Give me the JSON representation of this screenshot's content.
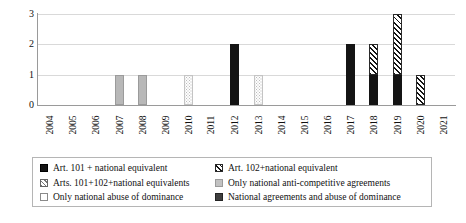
{
  "chart_data": {
    "type": "bar",
    "stacked": true,
    "title": "",
    "xlabel": "",
    "ylabel": "",
    "ylim": [
      0,
      3
    ],
    "yticks": [
      "0",
      "1",
      "2",
      "3"
    ],
    "grid": true,
    "legend_position": "bottom",
    "categories": [
      "2004",
      "2005",
      "2006",
      "2007",
      "2008",
      "2009",
      "2010",
      "2011",
      "2012",
      "2013",
      "2014",
      "2015",
      "2016",
      "2017",
      "2018",
      "2019",
      "2020",
      "2021"
    ],
    "series": [
      {
        "name": "Art. 101 + national equivalent",
        "key": "s101",
        "values": [
          0,
          0,
          0,
          0,
          0,
          0,
          0,
          0,
          2,
          0,
          0,
          0,
          0,
          2,
          1,
          1,
          0,
          0
        ]
      },
      {
        "name": "Art. 102+national equivalent",
        "key": "s102",
        "values": [
          0,
          0,
          0,
          0,
          0,
          0,
          0,
          0,
          0,
          0,
          0,
          0,
          0,
          0,
          1,
          2,
          1,
          0
        ]
      },
      {
        "name": "Arts. 101+102+national equivalents",
        "key": "sboth",
        "values": [
          0,
          0,
          0,
          0,
          0,
          0,
          0,
          0,
          0,
          0,
          0,
          0,
          0,
          0,
          0,
          0,
          0,
          0
        ]
      },
      {
        "name": "Only national anti-competitive agreements",
        "key": "snatagr",
        "values": [
          0,
          0,
          0,
          1,
          1,
          0,
          0,
          0,
          0,
          0,
          0,
          0,
          0,
          0,
          0,
          0,
          0,
          0
        ]
      },
      {
        "name": "Only national abuse of dominance",
        "key": "snatdom",
        "values": [
          0,
          0,
          0,
          0,
          0,
          0,
          1,
          0,
          0,
          1,
          0,
          0,
          0,
          0,
          0,
          0,
          0,
          0
        ]
      },
      {
        "name": "National agreements and abuse of dominance",
        "key": "snatmix",
        "values": [
          0,
          0,
          0,
          0,
          0,
          0,
          0,
          0,
          0,
          0,
          0,
          0,
          0,
          0,
          0,
          0,
          0,
          0
        ]
      }
    ],
    "totals": [
      0,
      0,
      0,
      1,
      1,
      0,
      1,
      0,
      2,
      1,
      0,
      0,
      0,
      2,
      2,
      3,
      1,
      0
    ]
  },
  "legend": {
    "items": [
      {
        "label": "Art. 101 + national equivalent",
        "key": "s101"
      },
      {
        "label": "Arts. 101+102+national equivalents",
        "key": "sboth"
      },
      {
        "label": "Only national abuse of dominance",
        "key": "snatdom"
      },
      {
        "label": "Art. 102+national equivalent",
        "key": "s102"
      },
      {
        "label": "Only national anti-competitive agreements",
        "key": "snatagr"
      },
      {
        "label": "National agreements and abuse of dominance",
        "key": "snatmix"
      }
    ]
  },
  "colors": {
    "art101": "#141414",
    "art102_hatch": "#141414",
    "national_agreements": "#b8b8b8",
    "national_dominance": "#bdbdbd",
    "national_mixed": "#3a3a3a",
    "gridline": "#d9d9d9",
    "axis": "#9a9a9a"
  }
}
